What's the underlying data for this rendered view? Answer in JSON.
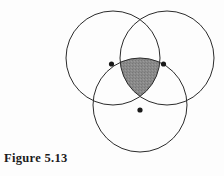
{
  "figure": {
    "caption": "Figure 5.13",
    "background_color": "#fdfdfd",
    "stroke_color": "#2b2b2b",
    "stroke_width": 1,
    "shaded_region": {
      "name": "triple-intersection",
      "fill_color": "#8a8a8a",
      "description": "Reuleaux-triangle shaped region common to all three circles"
    },
    "vertex_dot": {
      "color": "#1a1a1a",
      "radius": 2.6
    },
    "circles": [
      {
        "label": "top-left-circle",
        "cx": 113,
        "cy": 58,
        "r": 47
      },
      {
        "label": "top-right-circle",
        "cx": 167,
        "cy": 58,
        "r": 47
      },
      {
        "label": "bottom-circle",
        "cx": 140,
        "cy": 105,
        "r": 47
      }
    ],
    "vertices": [
      {
        "label": "left-vertex",
        "x": 111.5,
        "y": 64
      },
      {
        "label": "right-vertex",
        "x": 163.5,
        "y": 64
      },
      {
        "label": "bottom-vertex",
        "x": 140,
        "y": 110
      }
    ]
  }
}
